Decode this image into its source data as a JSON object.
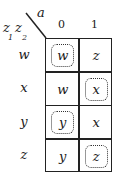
{
  "diagram": {
    "type": "karnaugh-map",
    "corner": {
      "column_variable": "a",
      "row_variables": [
        "z",
        "z"
      ],
      "row_subscripts": [
        "1",
        "2"
      ]
    },
    "column_headers": [
      "0",
      "1"
    ],
    "row_headers": [
      "w",
      "x",
      "y",
      "z"
    ],
    "cells": [
      [
        {
          "value": "w",
          "circled": true
        },
        {
          "value": "z",
          "circled": false
        }
      ],
      [
        {
          "value": "w",
          "circled": false
        },
        {
          "value": "x",
          "circled": true
        }
      ],
      [
        {
          "value": "y",
          "circled": true
        },
        {
          "value": "x",
          "circled": false
        }
      ],
      [
        {
          "value": "y",
          "circled": false
        },
        {
          "value": "z",
          "circled": true
        }
      ]
    ]
  }
}
